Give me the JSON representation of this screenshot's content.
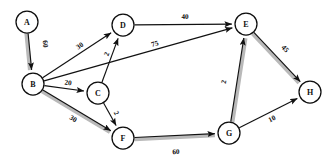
{
  "figure": {
    "type": "directed-weighted-graph",
    "background_color": "#ffffff",
    "node_fill": "#ffffff",
    "node_stroke": "#0d0d0d",
    "edge_color": "#111111",
    "highlight_color": "#b9b9b9"
  },
  "chart_data": {
    "type": "diagram",
    "title": "",
    "nodes": [
      {
        "id": "A",
        "label": "A",
        "x": 27,
        "y": 22,
        "r": 11
      },
      {
        "id": "B",
        "label": "B",
        "x": 33,
        "y": 84,
        "r": 11
      },
      {
        "id": "C",
        "label": "C",
        "x": 98,
        "y": 93,
        "r": 11
      },
      {
        "id": "D",
        "label": "D",
        "x": 123,
        "y": 25,
        "r": 11
      },
      {
        "id": "E",
        "label": "E",
        "x": 246,
        "y": 24,
        "r": 11
      },
      {
        "id": "F",
        "label": "F",
        "x": 123,
        "y": 138,
        "r": 11
      },
      {
        "id": "G",
        "label": "G",
        "x": 229,
        "y": 133,
        "r": 11
      },
      {
        "id": "H",
        "label": "H",
        "x": 310,
        "y": 92,
        "r": 11
      }
    ],
    "edges": [
      {
        "from": "A",
        "to": "B",
        "weight": 60,
        "highlighted": true,
        "label_x": 45,
        "label_y": 44
      },
      {
        "from": "B",
        "to": "D",
        "weight": 30,
        "highlighted": false,
        "label_x": 80,
        "label_y": 46
      },
      {
        "from": "B",
        "to": "C",
        "weight": 20,
        "highlighted": false,
        "label_x": 68,
        "label_y": 83
      },
      {
        "from": "B",
        "to": "F",
        "weight": 30,
        "highlighted": true,
        "label_x": 73,
        "label_y": 119
      },
      {
        "from": "B",
        "to": "E",
        "weight": 75,
        "highlighted": false,
        "label_x": 155,
        "label_y": 44
      },
      {
        "from": "C",
        "to": "D",
        "weight": 2,
        "highlighted": false,
        "label_x": 107,
        "label_y": 54
      },
      {
        "from": "C",
        "to": "F",
        "weight": 2,
        "highlighted": false,
        "label_x": 116,
        "label_y": 113
      },
      {
        "from": "D",
        "to": "E",
        "weight": 40,
        "highlighted": false,
        "label_x": 185,
        "label_y": 17
      },
      {
        "from": "F",
        "to": "G",
        "weight": 60,
        "highlighted": true,
        "label_x": 176,
        "label_y": 152
      },
      {
        "from": "G",
        "to": "E",
        "weight": 2,
        "highlighted": true,
        "label_x": 224,
        "label_y": 82
      },
      {
        "from": "G",
        "to": "H",
        "weight": 10,
        "highlighted": false,
        "label_x": 272,
        "label_y": 119
      },
      {
        "from": "E",
        "to": "H",
        "weight": 45,
        "highlighted": true,
        "label_x": 285,
        "label_y": 49
      }
    ],
    "legend": [],
    "xlabel": "",
    "ylabel": ""
  }
}
